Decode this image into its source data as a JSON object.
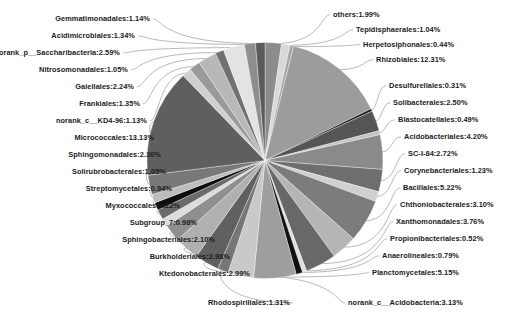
{
  "chart_data": {
    "type": "pie",
    "title": "",
    "subtitle": "",
    "xlabel": "",
    "ylabel": "",
    "legend_position": "none",
    "grid": false,
    "label_format": "name:value%",
    "units": "percent",
    "start_angle_deg": 0,
    "direction": "clockwise",
    "total": 100.0,
    "categories": [
      "others",
      "Tepidisphaerales",
      "Herpetosiphonales",
      "Rhizobiales",
      "Desulfurellales",
      "Solibacterales",
      "Blastocatellales",
      "Acidobacteriales",
      "SC-I-84",
      "Corynebacteriales",
      "Bacillales",
      "Chthoniobacterales",
      "Xanthomonadales",
      "Propionibacteriales",
      "Anaerolineales",
      "Planctomycetales",
      "norank_c__Acidobacteria",
      "Rhodospirillales",
      "Ktedonobacterales",
      "Burkholderiales",
      "Sphingobacteriales",
      "Subgroup_7",
      "Myxococcales",
      "Streptomycetales",
      "Solirubrobacterales",
      "Sphingomonadales",
      "Micrococcales",
      "norank_c__KD4-96",
      "Frankiales",
      "Gaiellales",
      "Nitrosomonadales",
      "norank_p__Saccharibacteria",
      "Acidimicrobiales",
      "Gemmatimonadales"
    ],
    "values": [
      1.99,
      1.04,
      0.44,
      12.31,
      0.31,
      2.5,
      0.49,
      4.2,
      2.72,
      1.23,
      5.22,
      3.1,
      3.76,
      0.52,
      0.79,
      5.15,
      3.13,
      1.31,
      2.99,
      2.98,
      2.1,
      0.98,
      1.22,
      0.94,
      1.05,
      2.36,
      13.13,
      1.13,
      1.35,
      2.24,
      1.05,
      2.59,
      1.34,
      1.14
    ],
    "colors": [
      "#8c8c8c",
      "#d9d9d9",
      "#a6a6a6",
      "#9c9c9c",
      "#1a1a1a",
      "#555555",
      "#c4c4c4",
      "#8a8a8a",
      "#6e6e6e",
      "#d0d0d0",
      "#7c7c7c",
      "#b5b5b5",
      "#686868",
      "#e0e0e0",
      "#111111",
      "#9e9e9e",
      "#c9c9c9",
      "#767676",
      "#606060",
      "#b0b0b0",
      "#8f8f8f",
      "#dcdcdc",
      "#6a6a6a",
      "#0d0d0d",
      "#bdbdbd",
      "#787878",
      "#5f5f5f",
      "#cfcfcf",
      "#9a9a9a",
      "#b8b8b8",
      "#717171",
      "#e3e3e3",
      "#8e8e8e",
      "#5b5b5b"
    ],
    "labels": [
      "others:1.99%",
      "Tepidisphaerales:1.04%",
      "Herpetosiphonales:0.44%",
      "Rhizobiales:12.31%",
      "Desulfurellales:0.31%",
      "Solibacterales:2.50%",
      "Blastocatellales:0.49%",
      "Acidobacteriales:4.20%",
      "SC-I-84:2.72%",
      "Corynebacteriales:1.23%",
      "Bacillales:5.22%",
      "Chthoniobacterales:3.10%",
      "Xanthomonadales:3.76%",
      "Propionibacteriales:0.52%",
      "Anaerolineales:0.79%",
      "Planctomycetales:5.15%",
      "norank_c__Acidobacteria:3.13%",
      "Rhodospirillales:1.31%",
      "Ktedonobacterales:2.99%",
      "Burkholderiales:2.98%",
      "Sphingobacteriales:2.10%",
      "Subgroup_7:0.98%",
      "Myxococcales:1.22%",
      "Streptomycetales:0.94%",
      "Solirubrobacterales:1.05%",
      "Sphingomonadales:2.36%",
      "Micrococcales:13.13%",
      "norank_c__KD4-96:1.13%",
      "Frankiales:1.35%",
      "Gaiellales:2.24%",
      "Nitrosomonadales:1.05%",
      "norank_p__Saccharibacteria:2.59%",
      "Acidimicrobiales:1.34%",
      "Gemmatimonadales:1.14%"
    ]
  },
  "label_layout": {
    "right": [
      {
        "index": 0,
        "x": 333,
        "y": 17,
        "text": "others:1.99%"
      },
      {
        "index": 1,
        "x": 356,
        "y": 32,
        "text": "Tepidisphaerales:1.04%"
      },
      {
        "index": 2,
        "x": 363,
        "y": 47,
        "text": "Herpetosiphonales:0.44%"
      },
      {
        "index": 3,
        "x": 376,
        "y": 62,
        "text": "Rhizobiales:12.31%"
      },
      {
        "index": 4,
        "x": 389,
        "y": 88,
        "text": "Desulfurellales:0.31%"
      },
      {
        "index": 5,
        "x": 393,
        "y": 105,
        "text": "Solibacterales:2.50%"
      },
      {
        "index": 6,
        "x": 398,
        "y": 122,
        "text": "Blastocatellales:0.49%"
      },
      {
        "index": 7,
        "x": 404,
        "y": 139,
        "text": "Acidobacteriales:4.20%"
      },
      {
        "index": 8,
        "x": 408,
        "y": 156,
        "text": "SC-I-84:2.72%"
      },
      {
        "index": 9,
        "x": 404,
        "y": 173,
        "text": "Corynebacteriales:1.23%"
      },
      {
        "index": 10,
        "x": 403,
        "y": 190,
        "text": "Bacillales:5.22%"
      },
      {
        "index": 11,
        "x": 400,
        "y": 207,
        "text": "Chthoniobacterales:3.10%"
      },
      {
        "index": 12,
        "x": 396,
        "y": 224,
        "text": "Xanthomonadales:3.76%"
      },
      {
        "index": 13,
        "x": 390,
        "y": 241,
        "text": "Propionibacteriales:0.52%"
      },
      {
        "index": 14,
        "x": 382,
        "y": 258,
        "text": "Anaerolineales:0.79%"
      },
      {
        "index": 15,
        "x": 372,
        "y": 275,
        "text": "Planctomycetales:5.15%"
      },
      {
        "index": 16,
        "x": 348,
        "y": 305,
        "text": "norank_c__Acidobacteria:3.13%"
      }
    ],
    "left": [
      {
        "index": 17,
        "x": 290,
        "y": 305,
        "text": "Rhodospirillales:1.31%"
      },
      {
        "index": 18,
        "x": 250,
        "y": 276,
        "text": "Ktedonobacterales:2.99%"
      },
      {
        "index": 19,
        "x": 230,
        "y": 259,
        "text": "Burkholderiales:2.98%"
      },
      {
        "index": 20,
        "x": 215,
        "y": 242,
        "text": "Sphingobacteriales:2.10%"
      },
      {
        "index": 21,
        "x": 197,
        "y": 225,
        "text": "Subgroup_7:0.98%"
      },
      {
        "index": 22,
        "x": 180,
        "y": 208,
        "text": "Myxococcales:1.22%"
      },
      {
        "index": 23,
        "x": 172,
        "y": 191,
        "text": "Streptomycetales:0.94%"
      },
      {
        "index": 24,
        "x": 166,
        "y": 174,
        "text": "Solirubrobacterales:1.05%"
      },
      {
        "index": 25,
        "x": 161,
        "y": 157,
        "text": "Sphingomonadales:2.36%"
      },
      {
        "index": 26,
        "x": 154,
        "y": 140,
        "text": "Micrococcales:13.13%"
      },
      {
        "index": 27,
        "x": 147,
        "y": 123,
        "text": "norank_c__KD4-96:1.13%"
      },
      {
        "index": 28,
        "x": 140,
        "y": 106,
        "text": "Frankiales:1.35%"
      },
      {
        "index": 29,
        "x": 134,
        "y": 89,
        "text": "Gaiellales:2.24%"
      },
      {
        "index": 30,
        "x": 128,
        "y": 72,
        "text": "Nitrosomonadales:1.05%"
      },
      {
        "index": 31,
        "x": 120,
        "y": 55,
        "text": "norank_p__Saccharibacteria:2.59%"
      },
      {
        "index": 32,
        "x": 135,
        "y": 38,
        "text": "Acidimicrobiales:1.34%"
      },
      {
        "index": 33,
        "x": 150,
        "y": 21,
        "text": "Gemmatimonadales:1.14%"
      }
    ]
  },
  "caption": {
    "text": ""
  }
}
